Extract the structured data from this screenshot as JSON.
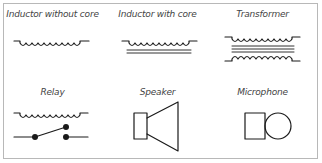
{
  "diagram": {
    "border_color": "#b8b8b8",
    "symbols": [
      {
        "label": "Inductor without core",
        "icon": "inductor-icon",
        "row": 1,
        "col": 1
      },
      {
        "label": "Inductor with core",
        "icon": "inductor-core-icon",
        "row": 1,
        "col": 2
      },
      {
        "label": "Transformer",
        "icon": "transformer-icon",
        "row": 1,
        "col": 3
      },
      {
        "label": "Relay",
        "icon": "relay-icon",
        "row": 2,
        "col": 1
      },
      {
        "label": "Speaker",
        "icon": "speaker-icon",
        "row": 2,
        "col": 2
      },
      {
        "label": "Microphone",
        "icon": "microphone-icon",
        "row": 2,
        "col": 3
      }
    ]
  }
}
